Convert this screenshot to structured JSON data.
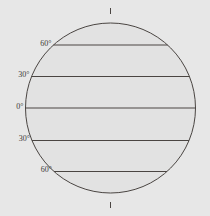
{
  "figure": {
    "width": 210,
    "height": 216,
    "background_color": "#e7e7e7"
  },
  "globe": {
    "name": "globe-sphere",
    "center_x": 110.5,
    "center_y": 108,
    "radius": 85,
    "fill_color": "#e2e2e2",
    "outline_color": "#4a4542",
    "outline_width": 1
  },
  "graticule": {
    "line_color": "#4a4542",
    "line_width": 1,
    "label_color": "#3c3a38",
    "latitudes": [
      {
        "label": "60°",
        "value": 60,
        "hemisphere": "N",
        "y": 45,
        "half_width": 72
      },
      {
        "label": "30°",
        "value": 30,
        "hemisphere": "N",
        "y": 76.5,
        "half_width": 82
      },
      {
        "label": "0°",
        "value": 0,
        "hemisphere": "",
        "y": 108,
        "half_width": 85
      },
      {
        "label": "30°",
        "value": -30,
        "hemisphere": "S",
        "y": 140.5,
        "half_width": 82
      },
      {
        "label": "60°",
        "value": -60,
        "hemisphere": "S",
        "y": 171.5,
        "half_width": 72
      }
    ]
  },
  "poles": {
    "north": {
      "name": "north-pole-tick",
      "x": 110.5,
      "y_top": 8,
      "y_bottom": 14
    },
    "south": {
      "name": "south-pole-tick",
      "x": 110.5,
      "y_top": 202,
      "y_bottom": 208
    }
  },
  "chart_data": {
    "type": "diagram",
    "subtitle": "",
    "xlabel": "",
    "ylabel": "Latitude",
    "projection": "orthographic-equatorial",
    "grid": true,
    "legend": "none",
    "categories": [
      "60°",
      "30°",
      "0°",
      "30°",
      "60°"
    ],
    "values": [
      60,
      30,
      0,
      -30,
      -60
    ],
    "annotations": [
      "north pole tick",
      "south pole tick"
    ]
  }
}
